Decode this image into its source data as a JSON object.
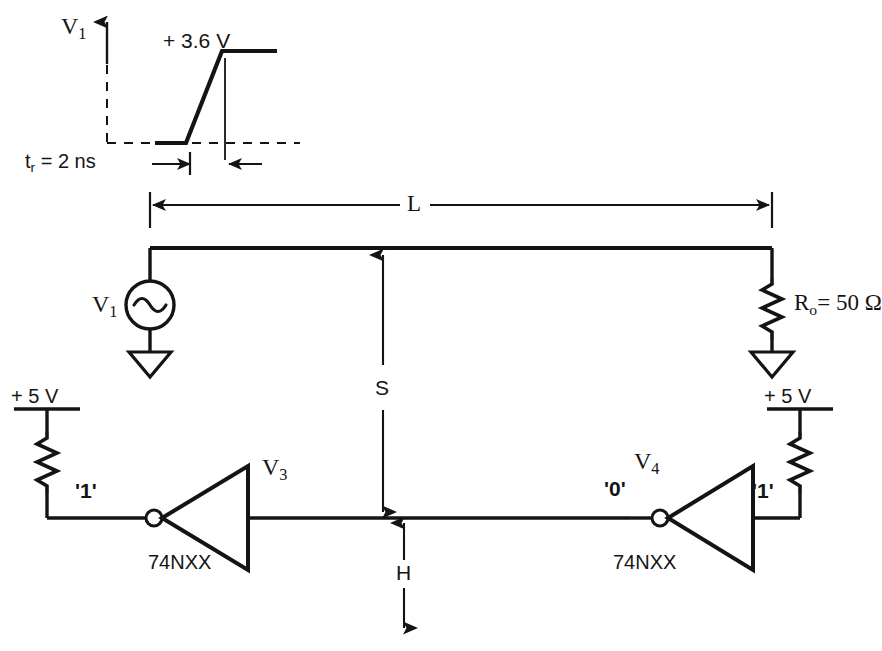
{
  "figure": {
    "type": "circuit-schematic",
    "ink_color": "#141414",
    "background_color": "#ffffff"
  },
  "waveform": {
    "axis_label": "V",
    "axis_label_sub": "1",
    "amplitude_label": "+ 3.6 V",
    "rise_time_label": "t",
    "rise_time_label_sub": "r",
    "rise_time_value": "= 2 ns",
    "style": "ramp-step",
    "low_level": "0",
    "high_level": "+3.6"
  },
  "transmission_line": {
    "length_label": "L",
    "source_label": "V",
    "source_label_sub": "1",
    "source_type": "ac-source",
    "termination_label": "R",
    "termination_label_sub": "o",
    "termination_value": "= 50 Ω",
    "termination_type": "resistor-to-ground"
  },
  "spacing": {
    "vertical_separation_label": "S",
    "height_above_ground_label": "H"
  },
  "logic_left": {
    "supply_label": "+ 5 V",
    "pullup": "resistor",
    "input_state": "'1'",
    "device_label": "74NXX",
    "device_type": "inverter",
    "output_label": "V",
    "output_label_sub": "3"
  },
  "logic_right": {
    "supply_label": "+ 5 V",
    "pullup": "resistor",
    "input_state": "'0'",
    "device_label": "74NXX",
    "device_type": "inverter",
    "output_state": "'1'",
    "node_label": "V",
    "node_label_sub": "4"
  }
}
